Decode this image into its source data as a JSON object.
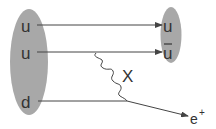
{
  "diagram": {
    "initial_state": {
      "shape": "ellipse",
      "color": "#a8a8a8",
      "quarks": [
        {
          "label": "u"
        },
        {
          "label": "u"
        },
        {
          "label": "d"
        }
      ]
    },
    "final_state_meson": {
      "shape": "ellipse",
      "color": "#a8a8a8",
      "quarks": [
        {
          "label": "u"
        },
        {
          "label": "u",
          "overline": true
        }
      ]
    },
    "boson": {
      "label": "X"
    },
    "lepton": {
      "label": "e",
      "superscript": "+"
    },
    "line_color": "#444444"
  }
}
